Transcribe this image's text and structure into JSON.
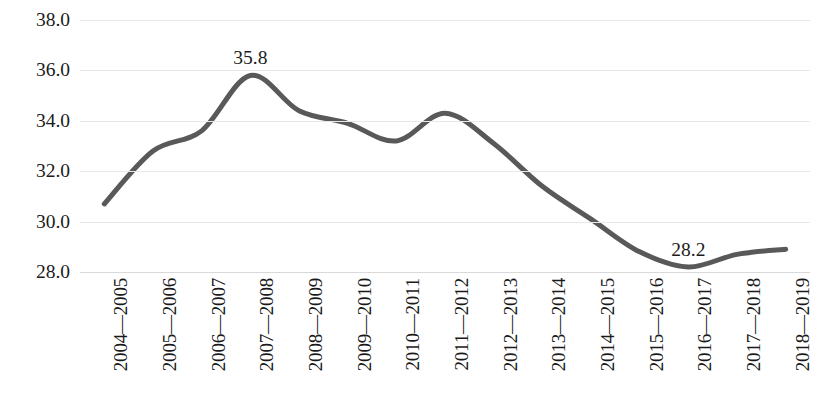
{
  "chart_data": {
    "type": "line",
    "title": "",
    "subtitle": "",
    "xlabel": "",
    "ylabel": "",
    "categories": [
      "2004—2005",
      "2005—2006",
      "2006—2007",
      "2007—2008",
      "2008—2009",
      "2009—2010",
      "2010—2011",
      "2011—2012",
      "2012—2013",
      "2013—2014",
      "2014—2015",
      "2015—2016",
      "2016—2017",
      "2017—2018",
      "2018—2019"
    ],
    "values": [
      30.7,
      32.8,
      33.6,
      35.8,
      34.4,
      33.9,
      33.2,
      34.3,
      33.1,
      31.4,
      30.1,
      28.8,
      28.2,
      28.7,
      28.9
    ],
    "ylim": [
      28.0,
      38.0
    ],
    "y_ticks": [
      "38.0",
      "36.0",
      "34.0",
      "32.0",
      "30.0",
      "28.0"
    ],
    "y_tick_values": [
      38.0,
      36.0,
      34.0,
      32.0,
      30.0,
      28.0
    ],
    "grid": true,
    "legend": false,
    "legend_position": "none",
    "smooth": true,
    "series_color": "#595959",
    "gridline_color": "#e8e8e8",
    "text_color": "#1a1a1a",
    "point_labels": [
      {
        "category": "2007—2008",
        "value": "35.8"
      },
      {
        "category": "2016—2017",
        "value": "28.2"
      }
    ]
  }
}
